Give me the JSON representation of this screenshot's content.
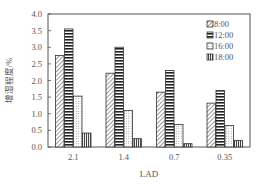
{
  "chart_data": {
    "type": "bar",
    "title": "",
    "xlabel": "LAD",
    "ylabel": "增湿程度/%",
    "categories": [
      "2.1",
      "1.4",
      "0.7",
      "0.35"
    ],
    "series": [
      {
        "name": "8:00",
        "pattern": "diagonal",
        "values": [
          2.75,
          2.22,
          1.65,
          1.32
        ]
      },
      {
        "name": "12:00",
        "pattern": "horizontal",
        "values": [
          3.55,
          3.0,
          2.3,
          1.7
        ]
      },
      {
        "name": "16:00",
        "pattern": "dotted",
        "values": [
          1.53,
          1.1,
          0.68,
          0.65
        ]
      },
      {
        "name": "18:00",
        "pattern": "vertical",
        "values": [
          0.42,
          0.25,
          0.1,
          0.2
        ]
      }
    ],
    "ylim": [
      0,
      4.0
    ],
    "yticks": [
      "0.0",
      "0.5",
      "1.0",
      "1.5",
      "2.0",
      "2.5",
      "3.0",
      "3.5",
      "4.0"
    ],
    "grid": false,
    "legend_position": "upper right, inside"
  }
}
